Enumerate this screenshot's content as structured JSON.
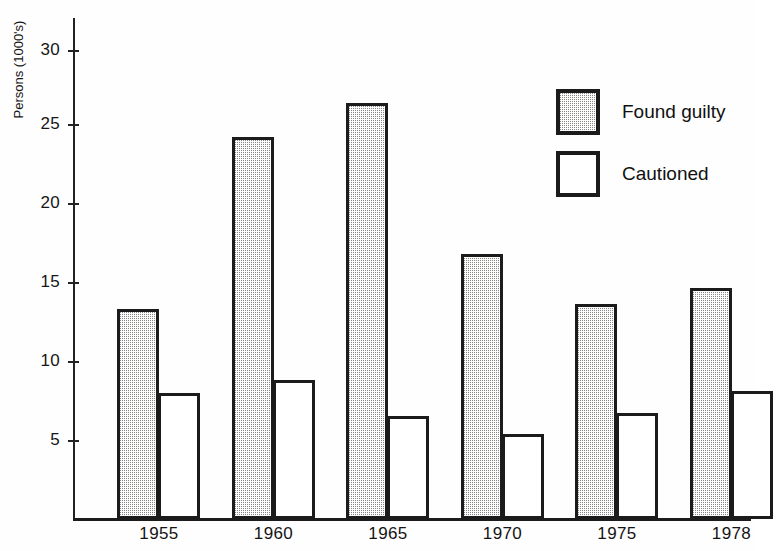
{
  "chart_data": {
    "type": "bar",
    "title": "",
    "subtitle": "",
    "xlabel": "",
    "ylabel": "Persons (1000's)",
    "categories": [
      "1955",
      "1960",
      "1965",
      "1970",
      "1975",
      "1978"
    ],
    "series": [
      {
        "name": "Found guilty",
        "style": "shaded",
        "values": [
          13.3,
          24.2,
          26.3,
          16.8,
          13.6,
          14.6
        ]
      },
      {
        "name": "Cautioned",
        "style": "open",
        "values": [
          8.0,
          8.8,
          6.5,
          5.4,
          6.7,
          8.1
        ]
      }
    ],
    "ylim": [
      0,
      31.5
    ],
    "yticks": [
      5,
      10,
      15,
      20,
      25,
      30
    ],
    "ytick_labels": [
      "5",
      "10",
      "15",
      "20",
      "25",
      "30"
    ],
    "grid": false,
    "legend_position": "upper-right",
    "annotations": []
  },
  "legend": {
    "entries": [
      {
        "label": "Found guilty",
        "swatch": "shaded-square-swatch"
      },
      {
        "label": "Cautioned",
        "swatch": "open-square-swatch"
      }
    ]
  },
  "axes": {
    "y_title": "Persons (1000's)",
    "y_tick_labels": [
      "30",
      "25",
      "20",
      "15",
      "10",
      "5"
    ],
    "x_tick_labels": [
      "1955",
      "1960",
      "1965",
      "1970",
      "1975",
      "1978"
    ]
  }
}
